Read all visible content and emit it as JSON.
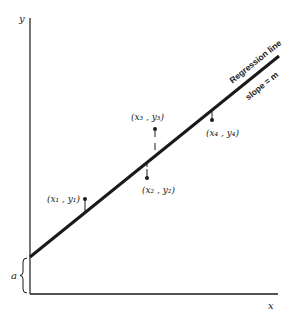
{
  "diagram": {
    "axes": {
      "y_label": "y",
      "x_label": "x"
    },
    "regression_line": {
      "label": "Regression line",
      "slope_label": "slope = m",
      "intercept_label": "a"
    },
    "points": [
      {
        "label": "(x₁ , y₁)",
        "position": "above line"
      },
      {
        "label": "(x₂ , y₂)",
        "position": "below line"
      },
      {
        "label": "(x₃ , y₃)",
        "position": "above line"
      },
      {
        "label": "(x₄ , y₄)",
        "position": "below line"
      }
    ],
    "colors": {
      "ink": "#1a1a1a",
      "background": "#ffffff"
    }
  }
}
